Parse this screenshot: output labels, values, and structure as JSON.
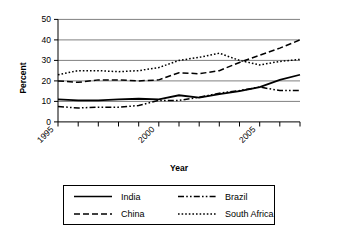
{
  "chart_data": {
    "type": "line",
    "title": "",
    "xlabel": "Year",
    "ylabel": "Percent",
    "x": [
      1995,
      1996,
      1997,
      1998,
      1999,
      2000,
      2001,
      2002,
      2003,
      2004,
      2005,
      2006,
      2007
    ],
    "xlim": [
      1995,
      2007
    ],
    "ylim": [
      0,
      50
    ],
    "yticks": [
      0,
      10,
      20,
      30,
      40,
      50
    ],
    "xticks_labeled": [
      1995,
      2000,
      2005
    ],
    "grid": "horizontal",
    "legend_position": "bottom",
    "series": [
      {
        "name": "India",
        "style": "solid",
        "values": [
          11,
          10.5,
          10.5,
          11,
          11.3,
          11,
          13,
          11.8,
          13.5,
          15,
          17,
          20.5,
          23
        ]
      },
      {
        "name": "China",
        "style": "dashed",
        "values": [
          20,
          19.3,
          20.5,
          20.5,
          20,
          20.5,
          24,
          23.5,
          25,
          29,
          32.5,
          36,
          40
        ]
      },
      {
        "name": "Brazil",
        "style": "dash-dot-dot",
        "values": [
          7.5,
          6.8,
          7.2,
          7.2,
          8,
          10.5,
          10.5,
          12,
          14,
          15.3,
          17,
          15.3,
          15.3
        ]
      },
      {
        "name": "South Africa",
        "style": "dotted",
        "values": [
          23,
          25,
          25,
          24.5,
          25,
          26.5,
          30,
          31.5,
          33.5,
          30,
          27.8,
          29.5,
          30.5
        ]
      }
    ]
  },
  "axes": {
    "y_title": "Percent",
    "x_title": "Year",
    "y_tick_labels": [
      "0",
      "10",
      "20",
      "30",
      "40",
      "50"
    ],
    "x_tick_labels": [
      "1995",
      "2000",
      "2005"
    ]
  },
  "legend": {
    "entries": [
      {
        "label": "India",
        "style": "solid"
      },
      {
        "label": "Brazil",
        "style": "dash-dot-dot"
      },
      {
        "label": "China",
        "style": "dashed"
      },
      {
        "label": "South Africa",
        "style": "dotted"
      }
    ]
  }
}
